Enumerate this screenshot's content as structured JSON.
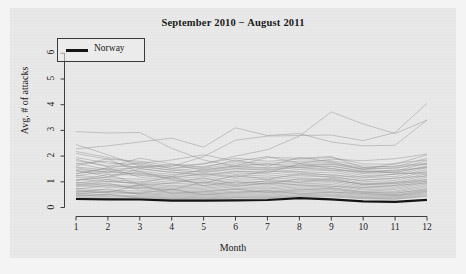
{
  "chart_data": {
    "type": "line",
    "title": "September 2010 − August 2011",
    "xlabel": "Month",
    "ylabel": "Avg. # of attacks",
    "xlim": [
      1,
      12
    ],
    "ylim": [
      0,
      6.4
    ],
    "xticks": [
      "1",
      "2",
      "3",
      "4",
      "5",
      "6",
      "7",
      "8",
      "9",
      "10",
      "11",
      "12"
    ],
    "yticks": [
      "0",
      "1",
      "2",
      "3",
      "4",
      "5",
      "6"
    ],
    "grid": false,
    "legend": {
      "position": "top-left",
      "entries": [
        "Norway"
      ]
    },
    "x": [
      1,
      2,
      3,
      4,
      5,
      6,
      7,
      8,
      9,
      10,
      11,
      12
    ],
    "highlight_series": {
      "name": "Norway",
      "color": "#141414",
      "width": 2.2,
      "values": [
        0.33,
        0.32,
        0.31,
        0.27,
        0.27,
        0.28,
        0.29,
        0.36,
        0.32,
        0.24,
        0.22,
        0.3
      ]
    },
    "background_series_color": "#8c8c8c",
    "series": [
      {
        "name": "country-01",
        "values": [
          2.95,
          2.9,
          2.92,
          2.3,
          1.85,
          1.6,
          1.7,
          1.55,
          1.45,
          1.4,
          1.35,
          1.3
        ]
      },
      {
        "name": "country-02",
        "values": [
          2.28,
          2.4,
          2.55,
          2.7,
          2.35,
          3.1,
          2.8,
          2.88,
          2.55,
          2.4,
          2.42,
          3.4
        ]
      },
      {
        "name": "country-03",
        "values": [
          2.45,
          2.05,
          1.62,
          1.6,
          1.98,
          2.62,
          2.78,
          2.8,
          2.82,
          2.6,
          2.92,
          4.05
        ]
      },
      {
        "name": "country-04",
        "values": [
          1.3,
          1.52,
          1.75,
          1.52,
          1.7,
          2.0,
          2.25,
          2.78,
          3.72,
          3.25,
          2.88,
          3.4
        ]
      },
      {
        "name": "country-05",
        "values": [
          2.1,
          1.88,
          1.8,
          1.62,
          1.7,
          1.92,
          1.8,
          1.88,
          1.95,
          1.7,
          1.68,
          2.05
        ]
      },
      {
        "name": "country-06",
        "values": [
          1.95,
          1.72,
          1.68,
          1.52,
          1.6,
          1.78,
          1.72,
          1.8,
          1.82,
          1.62,
          1.58,
          1.92
        ]
      },
      {
        "name": "country-07",
        "values": [
          1.82,
          1.62,
          1.58,
          1.45,
          1.52,
          1.7,
          1.65,
          1.72,
          1.75,
          1.55,
          1.5,
          1.82
        ]
      },
      {
        "name": "country-08",
        "values": [
          1.7,
          1.8,
          1.52,
          1.35,
          1.42,
          1.58,
          1.52,
          1.62,
          1.68,
          1.48,
          1.42,
          1.72
        ]
      },
      {
        "name": "country-09",
        "values": [
          1.58,
          1.45,
          1.42,
          1.28,
          1.35,
          1.5,
          1.45,
          1.55,
          1.6,
          1.4,
          1.35,
          1.62
        ]
      },
      {
        "name": "country-10",
        "values": [
          1.48,
          1.38,
          1.32,
          1.2,
          1.28,
          1.42,
          1.38,
          1.48,
          1.52,
          1.32,
          1.28,
          1.55
        ]
      },
      {
        "name": "country-11",
        "values": [
          1.4,
          1.3,
          1.25,
          1.12,
          1.2,
          1.35,
          1.3,
          1.4,
          1.45,
          1.25,
          1.2,
          1.48
        ]
      },
      {
        "name": "country-12",
        "values": [
          1.32,
          1.55,
          1.18,
          1.05,
          1.12,
          1.28,
          1.22,
          1.32,
          1.38,
          1.18,
          1.12,
          1.4
        ]
      },
      {
        "name": "country-13",
        "values": [
          1.25,
          1.15,
          1.1,
          0.98,
          1.05,
          1.2,
          1.15,
          1.25,
          1.3,
          1.1,
          1.05,
          1.32
        ]
      },
      {
        "name": "country-14",
        "values": [
          1.18,
          1.08,
          1.02,
          0.92,
          0.98,
          1.12,
          1.08,
          1.18,
          1.22,
          1.02,
          0.98,
          1.25
        ]
      },
      {
        "name": "country-15",
        "values": [
          1.1,
          1.0,
          0.95,
          0.85,
          0.92,
          1.05,
          1.0,
          1.1,
          1.15,
          0.95,
          0.92,
          1.18
        ]
      },
      {
        "name": "country-16",
        "values": [
          1.05,
          1.28,
          0.9,
          0.8,
          0.86,
          0.98,
          0.94,
          1.04,
          1.08,
          0.9,
          0.86,
          1.1
        ]
      },
      {
        "name": "country-17",
        "values": [
          0.98,
          0.9,
          0.85,
          0.75,
          0.8,
          0.92,
          0.88,
          0.98,
          1.02,
          0.84,
          0.8,
          1.04
        ]
      },
      {
        "name": "country-18",
        "values": [
          0.92,
          0.84,
          0.8,
          0.7,
          0.75,
          0.86,
          0.82,
          0.92,
          0.96,
          0.78,
          0.75,
          0.98
        ]
      },
      {
        "name": "country-19",
        "values": [
          0.86,
          0.78,
          0.74,
          0.65,
          0.7,
          0.8,
          0.76,
          0.86,
          0.9,
          0.72,
          0.7,
          0.92
        ]
      },
      {
        "name": "country-20",
        "values": [
          0.8,
          0.95,
          0.68,
          0.6,
          0.65,
          0.74,
          0.72,
          0.8,
          0.84,
          0.68,
          0.64,
          0.86
        ]
      },
      {
        "name": "country-21",
        "values": [
          0.74,
          0.68,
          0.64,
          0.56,
          0.6,
          0.7,
          0.66,
          0.75,
          0.78,
          0.62,
          0.6,
          0.8
        ]
      },
      {
        "name": "country-22",
        "values": [
          0.68,
          0.62,
          0.58,
          0.52,
          0.56,
          0.64,
          0.62,
          0.7,
          0.72,
          0.58,
          0.55,
          0.74
        ]
      },
      {
        "name": "country-23",
        "values": [
          0.62,
          0.56,
          0.54,
          0.48,
          0.52,
          0.6,
          0.57,
          0.64,
          0.68,
          0.54,
          0.5,
          0.68
        ]
      },
      {
        "name": "country-24",
        "values": [
          0.58,
          0.72,
          0.5,
          0.44,
          0.48,
          0.55,
          0.52,
          0.6,
          0.62,
          0.5,
          0.46,
          0.62
        ]
      },
      {
        "name": "country-25",
        "values": [
          0.54,
          0.5,
          0.46,
          0.4,
          0.44,
          0.5,
          0.48,
          0.55,
          0.58,
          0.46,
          0.43,
          0.58
        ]
      },
      {
        "name": "country-26",
        "values": [
          0.5,
          0.46,
          0.42,
          0.37,
          0.4,
          0.46,
          0.44,
          0.5,
          0.53,
          0.42,
          0.4,
          0.54
        ]
      },
      {
        "name": "country-27",
        "values": [
          0.46,
          0.42,
          0.39,
          0.34,
          0.37,
          0.42,
          0.41,
          0.46,
          0.49,
          0.39,
          0.37,
          0.5
        ]
      },
      {
        "name": "country-28",
        "values": [
          0.43,
          0.52,
          0.36,
          0.32,
          0.34,
          0.39,
          0.38,
          0.43,
          0.45,
          0.36,
          0.34,
          0.46
        ]
      },
      {
        "name": "country-29",
        "values": [
          0.4,
          0.37,
          0.34,
          0.3,
          0.32,
          0.36,
          0.35,
          0.4,
          0.42,
          0.34,
          0.32,
          0.43
        ]
      },
      {
        "name": "country-30",
        "values": [
          1.62,
          1.9,
          1.35,
          1.22,
          1.48,
          1.62,
          1.95,
          1.92,
          1.98,
          1.55,
          1.62,
          1.72
        ]
      },
      {
        "name": "country-31",
        "values": [
          1.45,
          1.2,
          1.5,
          1.38,
          1.25,
          1.4,
          1.35,
          1.7,
          1.52,
          1.35,
          1.45,
          1.55
        ]
      },
      {
        "name": "country-32",
        "values": [
          1.22,
          1.42,
          1.28,
          1.15,
          1.32,
          1.18,
          1.42,
          1.38,
          1.25,
          1.18,
          1.3,
          1.38
        ]
      },
      {
        "name": "country-33",
        "values": [
          1.05,
          1.18,
          1.4,
          1.08,
          0.95,
          1.25,
          1.1,
          1.3,
          1.18,
          1.05,
          1.15,
          1.22
        ]
      },
      {
        "name": "country-34",
        "values": [
          0.88,
          1.02,
          0.95,
          1.2,
          0.85,
          1.0,
          0.92,
          1.12,
          1.05,
          0.92,
          0.98,
          1.08
        ]
      },
      {
        "name": "country-35",
        "values": [
          0.72,
          0.85,
          0.78,
          0.68,
          1.0,
          0.82,
          0.96,
          0.88,
          0.82,
          0.78,
          0.86,
          0.95
        ]
      },
      {
        "name": "country-36",
        "values": [
          1.88,
          1.58,
          1.92,
          1.7,
          1.55,
          1.85,
          1.6,
          1.95,
          1.78,
          1.48,
          1.72,
          1.85
        ]
      },
      {
        "name": "country-37",
        "values": [
          2.18,
          1.95,
          1.72,
          1.85,
          2.05,
          1.8,
          1.98,
          1.72,
          1.88,
          1.82,
          1.9,
          2.08
        ]
      },
      {
        "name": "country-38",
        "values": [
          0.65,
          0.58,
          0.88,
          0.55,
          0.62,
          0.72,
          0.58,
          0.68,
          0.75,
          0.6,
          0.56,
          0.7
        ]
      },
      {
        "name": "country-39",
        "values": [
          0.52,
          0.62,
          0.55,
          0.72,
          0.5,
          0.58,
          0.66,
          0.52,
          0.6,
          0.55,
          0.48,
          0.64
        ]
      },
      {
        "name": "country-40",
        "values": [
          1.55,
          1.35,
          1.62,
          1.45,
          1.38,
          1.52,
          1.48,
          1.58,
          1.62,
          1.42,
          1.38,
          1.58
        ]
      },
      {
        "name": "country-41",
        "values": [
          0.95,
          1.08,
          0.88,
          0.95,
          1.15,
          0.9,
          1.05,
          0.98,
          1.12,
          0.88,
          0.94,
          1.02
        ]
      },
      {
        "name": "country-42",
        "values": [
          1.72,
          1.48,
          1.55,
          1.68,
          1.45,
          1.62,
          1.55,
          1.65,
          1.7,
          1.5,
          1.55,
          1.68
        ]
      }
    ]
  },
  "legend": {
    "norway_label": "Norway"
  }
}
